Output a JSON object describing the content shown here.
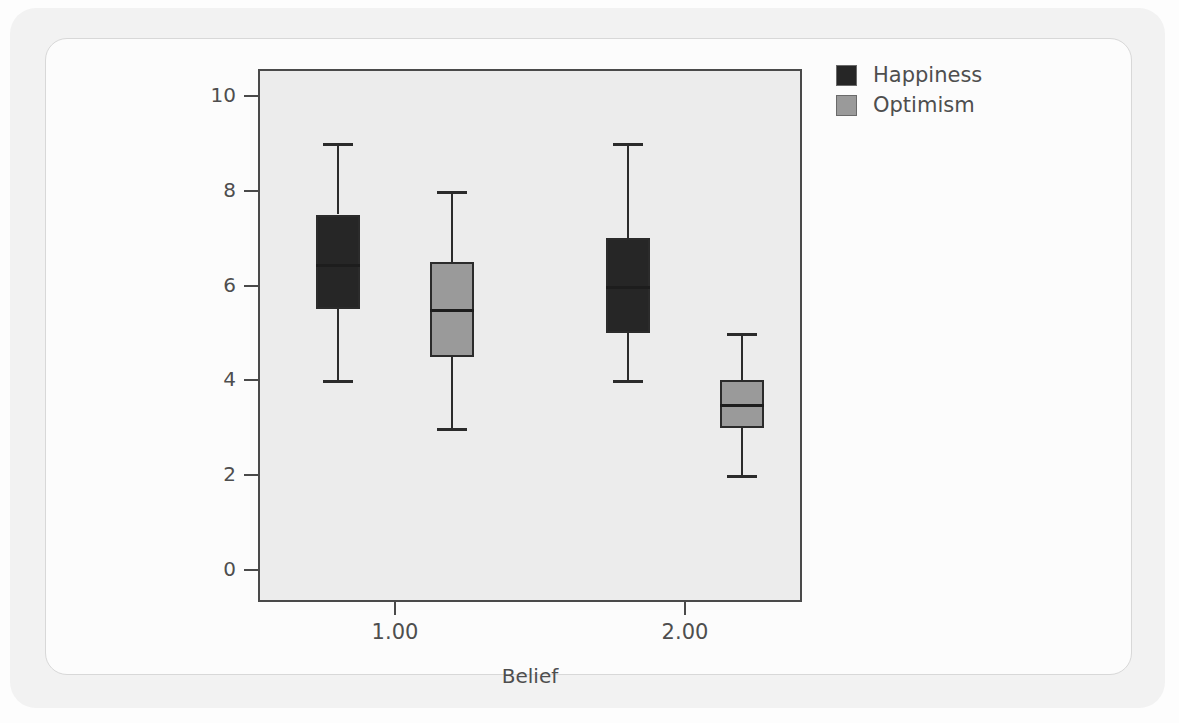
{
  "chart_data": {
    "type": "box",
    "title": "",
    "xlabel": "Belief",
    "ylabel": "",
    "ylim": [
      -0.5,
      10.7
    ],
    "yticks": [
      0,
      2,
      4,
      6,
      8,
      10
    ],
    "categories": [
      "1.00",
      "2.00"
    ],
    "grid": false,
    "legend_position": "top-right",
    "legend": [
      "Happiness",
      "Optimism"
    ],
    "colors": {
      "happiness": "#262626",
      "optimism": "#9a9a9a",
      "plot_background": "#ececec",
      "axis": "#4a4a4a",
      "text": "#4e4e4e",
      "card_background": "#f2f2f2"
    },
    "series": [
      {
        "name": "Happiness",
        "color": "#262626",
        "boxes": [
          {
            "category": "1.00",
            "whisker_low": 4.0,
            "q1": 5.5,
            "median": 6.45,
            "q3": 7.5,
            "whisker_high": 9.0
          },
          {
            "category": "2.00",
            "whisker_low": 4.0,
            "q1": 5.0,
            "median": 6.0,
            "q3": 7.0,
            "whisker_high": 9.0
          }
        ]
      },
      {
        "name": "Optimism",
        "color": "#9a9a9a",
        "boxes": [
          {
            "category": "1.00",
            "whisker_low": 3.0,
            "q1": 4.5,
            "median": 5.5,
            "q3": 6.5,
            "whisker_high": 8.0
          },
          {
            "category": "2.00",
            "whisker_low": 2.0,
            "q1": 3.0,
            "median": 3.5,
            "q3": 4.0,
            "whisker_high": 5.0
          }
        ]
      }
    ]
  },
  "axis": {
    "y_tick_labels": [
      "10",
      "8",
      "6",
      "4",
      "2",
      "0"
    ],
    "x_tick_labels": [
      "1.00",
      "2.00"
    ],
    "x_title": "Belief"
  },
  "legend": {
    "items": [
      {
        "label": "Happiness",
        "swatch": "#262626"
      },
      {
        "label": "Optimism",
        "swatch": "#9a9a9a"
      }
    ]
  }
}
